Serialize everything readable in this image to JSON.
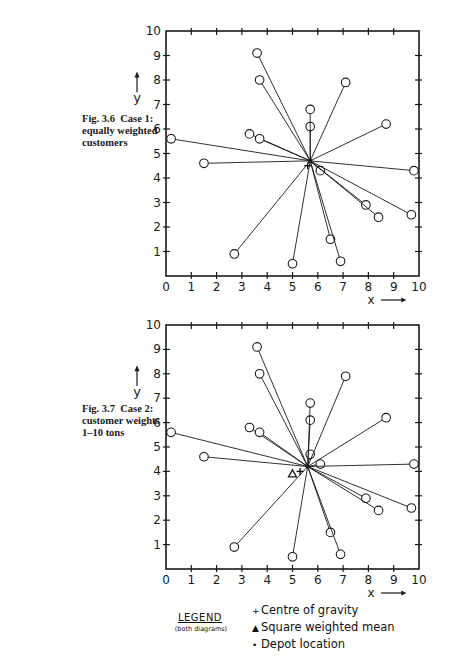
{
  "captions": [
    {
      "fig": "Fig. 3.6",
      "case": "Case 1:",
      "lines": [
        "equally weighted",
        "customers"
      ]
    },
    {
      "fig": "Fig. 3.7",
      "case": "Case 2:",
      "lines": [
        "customer weights",
        "1–10 tons"
      ]
    }
  ],
  "legend": {
    "title": "LEGEND",
    "subtitle": "(both diagrams)",
    "items": [
      {
        "symbol": "+",
        "label": "Centre of gravity"
      },
      {
        "symbol": "▲",
        "label": "Square weighted mean"
      },
      {
        "symbol": "•",
        "label": "Depot location"
      }
    ]
  },
  "chart_data": [
    {
      "type": "scatter",
      "title": "Fig. 3.6 Case 1: equally weighted customers",
      "xlabel": "x",
      "ylabel": "y",
      "xlim": [
        0,
        10
      ],
      "ylim": [
        0,
        10
      ],
      "xticks": [
        0,
        1,
        2,
        3,
        4,
        5,
        6,
        7,
        8,
        9,
        10
      ],
      "yticks": [
        0,
        1,
        2,
        3,
        4,
        5,
        6,
        7,
        8,
        9,
        10
      ],
      "grid": false,
      "customers": [
        {
          "x": 0.2,
          "y": 5.6
        },
        {
          "x": 1.5,
          "y": 4.6
        },
        {
          "x": 2.7,
          "y": 0.9
        },
        {
          "x": 3.3,
          "y": 5.8
        },
        {
          "x": 3.7,
          "y": 5.6
        },
        {
          "x": 3.6,
          "y": 9.1
        },
        {
          "x": 3.7,
          "y": 8.0
        },
        {
          "x": 5.0,
          "y": 0.5
        },
        {
          "x": 5.7,
          "y": 6.1
        },
        {
          "x": 5.7,
          "y": 6.8
        },
        {
          "x": 6.1,
          "y": 4.3
        },
        {
          "x": 6.5,
          "y": 1.5
        },
        {
          "x": 6.9,
          "y": 0.6
        },
        {
          "x": 7.1,
          "y": 7.9
        },
        {
          "x": 7.9,
          "y": 2.9
        },
        {
          "x": 8.4,
          "y": 2.4
        },
        {
          "x": 8.7,
          "y": 6.2
        },
        {
          "x": 9.7,
          "y": 2.5
        },
        {
          "x": 9.8,
          "y": 4.3
        }
      ],
      "depot": {
        "x": 5.7,
        "y": 4.7
      },
      "centre_of_gravity": {
        "x": 5.6,
        "y": 4.5
      }
    },
    {
      "type": "scatter",
      "title": "Fig. 3.7 Case 2: customer weights 1–10 tons",
      "xlabel": "x",
      "ylabel": "y",
      "xlim": [
        0,
        10
      ],
      "ylim": [
        0,
        10
      ],
      "xticks": [
        0,
        1,
        2,
        3,
        4,
        5,
        6,
        7,
        8,
        9,
        10
      ],
      "yticks": [
        0,
        1,
        2,
        3,
        4,
        5,
        6,
        7,
        8,
        9,
        10
      ],
      "grid": false,
      "customers": [
        {
          "x": 0.2,
          "y": 5.6
        },
        {
          "x": 1.5,
          "y": 4.6
        },
        {
          "x": 2.7,
          "y": 0.9
        },
        {
          "x": 3.3,
          "y": 5.8
        },
        {
          "x": 3.7,
          "y": 5.6
        },
        {
          "x": 3.6,
          "y": 9.1
        },
        {
          "x": 3.7,
          "y": 8.0
        },
        {
          "x": 5.0,
          "y": 0.5
        },
        {
          "x": 5.7,
          "y": 4.7
        },
        {
          "x": 5.7,
          "y": 6.1
        },
        {
          "x": 5.7,
          "y": 6.8
        },
        {
          "x": 6.1,
          "y": 4.3
        },
        {
          "x": 6.5,
          "y": 1.5
        },
        {
          "x": 6.9,
          "y": 0.6
        },
        {
          "x": 7.1,
          "y": 7.9
        },
        {
          "x": 7.9,
          "y": 2.9
        },
        {
          "x": 8.4,
          "y": 2.4
        },
        {
          "x": 8.7,
          "y": 6.2
        },
        {
          "x": 9.7,
          "y": 2.5
        },
        {
          "x": 9.8,
          "y": 4.3
        }
      ],
      "depot": {
        "x": 5.6,
        "y": 4.2
      },
      "centre_of_gravity": {
        "x": 5.3,
        "y": 4.0
      },
      "square_weighted_mean": {
        "x": 5.0,
        "y": 3.9
      }
    }
  ]
}
